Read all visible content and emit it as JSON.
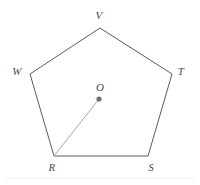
{
  "figure": {
    "type": "geometry-diagram",
    "shape_name": "pentagon",
    "background_color": "#ffffff",
    "outline_color": "#5a5a5a",
    "outline_width": 1,
    "radius_line_color": "#a8a8a8",
    "radius_line_width": 1,
    "center_dot_color": "#6e6e6e",
    "center_dot_radius": 2.6,
    "label_color": "#4a4a4a",
    "label_font_size": 11,
    "baseline_color": "#f2f2f2",
    "vertices": [
      {
        "id": "V",
        "label": "V",
        "x": 100,
        "y": 28,
        "label_x": 99,
        "label_y": 15
      },
      {
        "id": "T",
        "label": "T",
        "x": 172,
        "y": 74,
        "label_x": 181,
        "label_y": 71
      },
      {
        "id": "S",
        "label": "S",
        "x": 148,
        "y": 156,
        "label_x": 151,
        "label_y": 167
      },
      {
        "id": "R",
        "label": "R",
        "x": 54,
        "y": 156,
        "label_x": 52,
        "label_y": 167
      },
      {
        "id": "W",
        "label": "W",
        "x": 30,
        "y": 74,
        "label_x": 17,
        "label_y": 71
      }
    ],
    "edges": [
      {
        "from": "W",
        "to": "V"
      },
      {
        "from": "V",
        "to": "T"
      },
      {
        "from": "T",
        "to": "S"
      },
      {
        "from": "S",
        "to": "R"
      },
      {
        "from": "R",
        "to": "W"
      }
    ],
    "center": {
      "id": "O",
      "label": "O",
      "x": 99,
      "y": 99,
      "label_x": 100,
      "label_y": 87
    },
    "radius_segment": {
      "from": "R",
      "to": "O",
      "from_x": 54,
      "from_y": 156,
      "to_x": 99,
      "to_y": 99
    },
    "polygon_points": "100,28 172,74 148,156 54,156 30,74"
  }
}
